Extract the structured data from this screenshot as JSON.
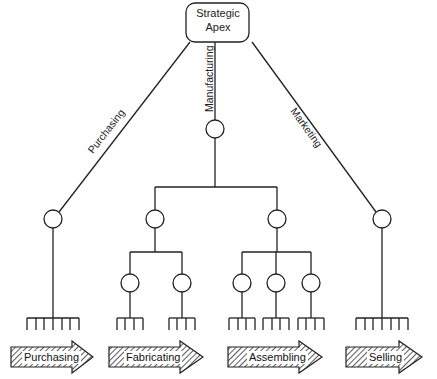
{
  "diagram": {
    "apex": {
      "line1": "Strategic",
      "line2": "Apex"
    },
    "edges": {
      "purchasing": "Purchasing",
      "manufacturing": "Manufacturing",
      "marketing": "Marketing"
    },
    "functions": [
      {
        "label": "Purchasing"
      },
      {
        "label": "Fabricating"
      },
      {
        "label": "Assembling"
      },
      {
        "label": "Selling"
      }
    ],
    "colors": {
      "line": "#222222",
      "hatch": "#333333"
    }
  }
}
